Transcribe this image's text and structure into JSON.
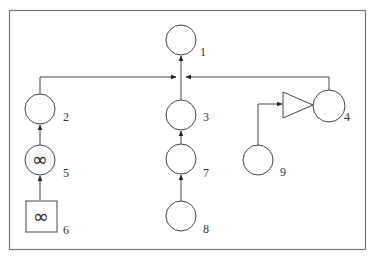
{
  "diagram": {
    "type": "block-diagram",
    "frame": {
      "stroke": "#777777"
    },
    "nodes": [
      {
        "id": "1",
        "label": "1",
        "shape": "circle",
        "symbol": ""
      },
      {
        "id": "2",
        "label": "2",
        "shape": "circle",
        "symbol": ""
      },
      {
        "id": "3",
        "label": "3",
        "shape": "circle",
        "symbol": ""
      },
      {
        "id": "4",
        "label": "4",
        "shape": "circle",
        "symbol": ""
      },
      {
        "id": "5",
        "label": "5",
        "shape": "circle",
        "symbol": "∞"
      },
      {
        "id": "6",
        "label": "6",
        "shape": "square",
        "symbol": "∞"
      },
      {
        "id": "7",
        "label": "7",
        "shape": "circle",
        "symbol": ""
      },
      {
        "id": "8",
        "label": "8",
        "shape": "circle",
        "symbol": ""
      },
      {
        "id": "9",
        "label": "9",
        "shape": "circle",
        "symbol": ""
      },
      {
        "id": "amp",
        "label": "",
        "shape": "triangle",
        "symbol": ""
      }
    ],
    "edges": [
      {
        "from": "6",
        "to": "5"
      },
      {
        "from": "5",
        "to": "2"
      },
      {
        "from": "2",
        "to": "1"
      },
      {
        "from": "8",
        "to": "7"
      },
      {
        "from": "7",
        "to": "3"
      },
      {
        "from": "3",
        "to": "1"
      },
      {
        "from": "4",
        "to": "1"
      },
      {
        "from": "9",
        "to": "amp"
      },
      {
        "from": "amp",
        "to": "4"
      }
    ]
  }
}
